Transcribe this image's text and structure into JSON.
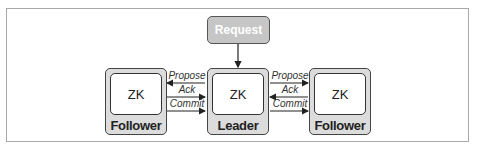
{
  "diagram": {
    "request": {
      "label": "Request",
      "fill": "#c6c6c6",
      "text_color": "#ffffff"
    },
    "nodes": [
      {
        "id": "follower-left",
        "inner_label": "ZK",
        "role": "Follower"
      },
      {
        "id": "leader",
        "inner_label": "ZK",
        "role": "Leader"
      },
      {
        "id": "follower-right",
        "inner_label": "ZK",
        "role": "Follower"
      }
    ],
    "left_links": {
      "propose": "Propose",
      "ack": "Ack",
      "commit": "Commit"
    },
    "right_links": {
      "propose": "Propose",
      "ack": "Ack",
      "commit": "Commit"
    },
    "colors": {
      "node_outer_fill": "#dcdcdc",
      "node_inner_fill": "#ffffff",
      "frame_border": "#a8a8a8",
      "stroke": "#333333"
    }
  }
}
